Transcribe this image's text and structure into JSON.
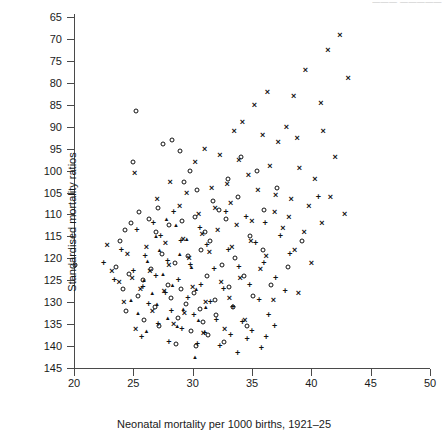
{
  "header_fragment": "———  —————",
  "axes": {
    "y_title": "Standardised mortality ratios",
    "x_title": "Neonatal mortality per 1000 births, 1921–25",
    "y_ticks": [
      "145",
      "140",
      "135",
      "130",
      "125",
      "120",
      "115",
      "110",
      "105",
      "100",
      "95",
      "90",
      "85",
      "80",
      "75",
      "70",
      "65"
    ],
    "x_ticks": [
      "20",
      "25",
      "30",
      "35",
      "40",
      "45",
      "50"
    ]
  },
  "chart_data": {
    "type": "scatter",
    "title": "",
    "xlabel": "Neonatal mortality per 1000 births, 1921-25",
    "ylabel": "Standardised mortality ratios",
    "xlim": [
      20,
      50
    ],
    "ylim": [
      65,
      145
    ],
    "xticks": [
      20,
      25,
      30,
      35,
      40,
      45,
      50
    ],
    "yticks": [
      65,
      70,
      75,
      80,
      85,
      90,
      95,
      100,
      105,
      110,
      115,
      120,
      125,
      130,
      135,
      140,
      145
    ],
    "grid": false,
    "legend": "none",
    "marker_types": [
      "circle",
      "cross",
      "plus",
      "triangle"
    ],
    "series": [
      {
        "name": "circle",
        "marker": "circle",
        "points": [
          [
            20.1,
            88.5
          ],
          [
            25.2,
            123.5
          ],
          [
            25.0,
            112.0
          ],
          [
            24.3,
            96.5
          ],
          [
            27.5,
            116.0
          ],
          [
            28.3,
            117.0
          ],
          [
            28.9,
            114.5
          ],
          [
            29.8,
            110.0
          ],
          [
            29.3,
            107.5
          ],
          [
            30.4,
            105.5
          ],
          [
            31.7,
            103.0
          ],
          [
            27.1,
            101.5
          ],
          [
            26.3,
            99.0
          ],
          [
            25.5,
            100.5
          ],
          [
            24.8,
            98.0
          ],
          [
            23.9,
            94.0
          ],
          [
            26.9,
            96.0
          ],
          [
            28.0,
            97.5
          ],
          [
            29.1,
            98.5
          ],
          [
            30.2,
            99.5
          ],
          [
            31.0,
            96.0
          ],
          [
            32.2,
            101.0
          ],
          [
            33.0,
            108.0
          ],
          [
            34.1,
            113.0
          ],
          [
            35.4,
            110.0
          ],
          [
            33.8,
            104.0
          ],
          [
            32.8,
            99.0
          ],
          [
            31.5,
            94.0
          ],
          [
            30.7,
            92.0
          ],
          [
            29.6,
            90.5
          ],
          [
            28.5,
            89.0
          ],
          [
            27.4,
            91.0
          ],
          [
            26.5,
            87.5
          ],
          [
            25.8,
            85.0
          ],
          [
            24.6,
            86.5
          ],
          [
            23.5,
            88.0
          ],
          [
            27.9,
            84.0
          ],
          [
            29.0,
            83.0
          ],
          [
            30.1,
            82.0
          ],
          [
            31.2,
            86.0
          ],
          [
            32.5,
            88.5
          ],
          [
            33.6,
            90.0
          ],
          [
            34.8,
            95.0
          ],
          [
            36.0,
            101.0
          ],
          [
            37.1,
            106.0
          ],
          [
            35.9,
            92.0
          ],
          [
            34.3,
            86.0
          ],
          [
            33.1,
            83.5
          ],
          [
            31.9,
            80.5
          ],
          [
            30.6,
            78.5
          ],
          [
            29.4,
            79.5
          ],
          [
            28.2,
            81.0
          ],
          [
            26.8,
            79.0
          ],
          [
            25.4,
            81.5
          ],
          [
            24.1,
            83.0
          ],
          [
            28.8,
            76.5
          ],
          [
            30.9,
            75.5
          ],
          [
            32.0,
            77.0
          ],
          [
            33.4,
            79.0
          ],
          [
            35.1,
            81.5
          ],
          [
            36.6,
            84.0
          ],
          [
            38.0,
            88.0
          ],
          [
            39.2,
            94.0
          ],
          [
            29.9,
            73.5
          ],
          [
            31.3,
            72.5
          ],
          [
            27.2,
            74.5
          ],
          [
            25.9,
            76.0
          ],
          [
            24.4,
            78.0
          ],
          [
            34.6,
            74.5
          ],
          [
            32.6,
            71.0
          ],
          [
            30.3,
            70.0
          ],
          [
            28.6,
            70.5
          ]
        ]
      },
      {
        "name": "cross",
        "marker": "cross",
        "points": [
          [
            42.4,
            141.0
          ],
          [
            41.4,
            137.5
          ],
          [
            39.5,
            133.0
          ],
          [
            36.3,
            128.0
          ],
          [
            38.5,
            127.0
          ],
          [
            35.2,
            125.0
          ],
          [
            34.2,
            121.0
          ],
          [
            37.9,
            120.0
          ],
          [
            40.8,
            125.5
          ],
          [
            43.1,
            131.0
          ],
          [
            33.5,
            119.0
          ],
          [
            35.9,
            118.0
          ],
          [
            37.2,
            116.5
          ],
          [
            38.8,
            117.5
          ],
          [
            41.0,
            119.0
          ],
          [
            42.0,
            113.0
          ],
          [
            31.0,
            115.0
          ],
          [
            32.3,
            113.5
          ],
          [
            30.2,
            112.0
          ],
          [
            33.9,
            112.5
          ],
          [
            36.5,
            111.0
          ],
          [
            39.0,
            110.5
          ],
          [
            40.3,
            108.0
          ],
          [
            34.7,
            109.0
          ],
          [
            32.9,
            107.0
          ],
          [
            31.6,
            106.0
          ],
          [
            29.5,
            105.0
          ],
          [
            28.1,
            107.5
          ],
          [
            35.5,
            105.5
          ],
          [
            37.0,
            104.5
          ],
          [
            38.3,
            103.5
          ],
          [
            39.8,
            102.0
          ],
          [
            41.6,
            104.0
          ],
          [
            33.2,
            102.5
          ],
          [
            31.9,
            101.5
          ],
          [
            30.5,
            100.0
          ],
          [
            28.9,
            102.0
          ],
          [
            27.0,
            103.5
          ],
          [
            25.1,
            109.5
          ],
          [
            36.9,
            100.5
          ],
          [
            38.1,
            99.5
          ],
          [
            35.0,
            98.5
          ],
          [
            33.7,
            97.5
          ],
          [
            32.1,
            96.5
          ],
          [
            30.8,
            95.5
          ],
          [
            29.2,
            94.5
          ],
          [
            27.7,
            93.5
          ],
          [
            26.1,
            92.5
          ],
          [
            24.5,
            91.0
          ],
          [
            22.8,
            93.0
          ],
          [
            37.6,
            97.0
          ],
          [
            39.4,
            96.0
          ],
          [
            40.9,
            98.0
          ],
          [
            42.8,
            100.0
          ],
          [
            34.9,
            94.0
          ],
          [
            33.3,
            92.5
          ],
          [
            31.4,
            91.5
          ],
          [
            29.7,
            90.0
          ],
          [
            28.0,
            88.5
          ],
          [
            26.4,
            87.0
          ],
          [
            24.9,
            85.5
          ],
          [
            23.2,
            87.0
          ],
          [
            36.2,
            90.5
          ],
          [
            38.6,
            92.0
          ],
          [
            40.0,
            89.0
          ],
          [
            35.7,
            87.5
          ],
          [
            34.0,
            85.5
          ],
          [
            32.4,
            84.5
          ],
          [
            30.0,
            83.5
          ],
          [
            27.6,
            82.5
          ],
          [
            25.6,
            83.0
          ],
          [
            23.8,
            84.5
          ],
          [
            33.1,
            81.0
          ],
          [
            31.1,
            80.0
          ],
          [
            29.3,
            77.5
          ],
          [
            26.6,
            78.0
          ],
          [
            24.2,
            80.0
          ],
          [
            36.8,
            80.5
          ],
          [
            38.9,
            82.0
          ],
          [
            34.4,
            76.0
          ],
          [
            32.7,
            74.0
          ],
          [
            30.9,
            73.0
          ],
          [
            28.4,
            75.0
          ],
          [
            25.2,
            74.0
          ]
        ]
      },
      {
        "name": "plus",
        "marker": "plus",
        "points": [
          [
            40.6,
            104.0
          ],
          [
            28.4,
            100.5
          ],
          [
            26.7,
            98.0
          ],
          [
            30.6,
            97.0
          ],
          [
            32.8,
            100.5
          ],
          [
            34.5,
            99.5
          ],
          [
            36.1,
            98.0
          ],
          [
            25.3,
            96.5
          ],
          [
            27.3,
            95.0
          ],
          [
            29.0,
            94.0
          ],
          [
            31.2,
            93.0
          ],
          [
            33.0,
            92.0
          ],
          [
            35.3,
            93.5
          ],
          [
            37.4,
            95.0
          ],
          [
            24.0,
            92.0
          ],
          [
            26.0,
            90.5
          ],
          [
            27.9,
            89.5
          ],
          [
            29.8,
            88.5
          ],
          [
            31.8,
            87.5
          ],
          [
            33.9,
            88.0
          ],
          [
            36.0,
            89.0
          ],
          [
            38.2,
            91.0
          ],
          [
            22.5,
            89.0
          ],
          [
            25.0,
            87.0
          ],
          [
            26.9,
            86.0
          ],
          [
            28.8,
            85.0
          ],
          [
            30.7,
            84.0
          ],
          [
            32.6,
            83.0
          ],
          [
            34.8,
            84.0
          ],
          [
            37.0,
            85.5
          ],
          [
            23.4,
            85.0
          ],
          [
            25.8,
            83.5
          ],
          [
            27.7,
            82.0
          ],
          [
            29.6,
            81.0
          ],
          [
            31.5,
            80.0
          ],
          [
            33.4,
            79.0
          ],
          [
            35.6,
            80.5
          ],
          [
            37.8,
            82.5
          ],
          [
            26.3,
            79.5
          ],
          [
            28.2,
            78.0
          ],
          [
            30.1,
            77.0
          ],
          [
            32.0,
            76.0
          ],
          [
            34.2,
            75.5
          ],
          [
            36.4,
            77.0
          ],
          [
            27.1,
            75.0
          ],
          [
            29.1,
            74.0
          ],
          [
            31.0,
            73.0
          ],
          [
            33.2,
            72.5
          ],
          [
            35.0,
            73.5
          ],
          [
            36.9,
            74.5
          ],
          [
            25.7,
            72.0
          ],
          [
            28.0,
            71.0
          ],
          [
            30.4,
            70.5
          ],
          [
            32.3,
            70.0
          ],
          [
            34.6,
            71.5
          ],
          [
            36.2,
            72.0
          ],
          [
            35.8,
            69.5
          ],
          [
            33.8,
            68.5
          ]
        ]
      },
      {
        "name": "triangle",
        "marker": "triangle",
        "points": [
          [
            27.8,
            99.0
          ],
          [
            28.6,
            97.5
          ],
          [
            26.9,
            95.0
          ],
          [
            29.5,
            94.5
          ],
          [
            27.2,
            92.0
          ],
          [
            28.9,
            91.0
          ],
          [
            26.2,
            89.5
          ],
          [
            29.9,
            88.0
          ],
          [
            27.5,
            86.5
          ],
          [
            25.9,
            85.0
          ],
          [
            28.3,
            84.0
          ],
          [
            30.3,
            83.0
          ],
          [
            26.6,
            82.0
          ],
          [
            24.8,
            80.5
          ],
          [
            27.0,
            79.5
          ],
          [
            29.2,
            78.5
          ],
          [
            31.1,
            79.0
          ],
          [
            25.4,
            77.5
          ],
          [
            27.9,
            76.5
          ],
          [
            30.5,
            76.0
          ],
          [
            28.7,
            74.5
          ],
          [
            26.1,
            73.5
          ],
          [
            30.2,
            67.5
          ]
        ]
      }
    ]
  }
}
